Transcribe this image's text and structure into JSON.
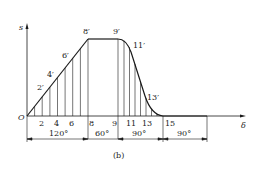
{
  "diagram": {
    "type": "cam-displacement-diagram",
    "axes": {
      "y_label": "s",
      "x_label": "δ",
      "origin_label": "O"
    },
    "curve_point_labels": [
      "2′",
      "4′",
      "6′",
      "8′",
      "9′",
      "11′",
      "13′"
    ],
    "x_tick_labels": [
      "2",
      "4",
      "6",
      "8",
      "9",
      "11",
      "13",
      "15"
    ],
    "segments": [
      {
        "label": "120°",
        "phase": "rise"
      },
      {
        "label": "60°",
        "phase": "dwell-high"
      },
      {
        "label": "90°",
        "phase": "return"
      },
      {
        "label": "90°",
        "phase": "dwell-low"
      }
    ],
    "caption": "(b)"
  },
  "colors": {
    "line": "#1a1a1a",
    "text": "#222222",
    "background": "#ffffff"
  }
}
